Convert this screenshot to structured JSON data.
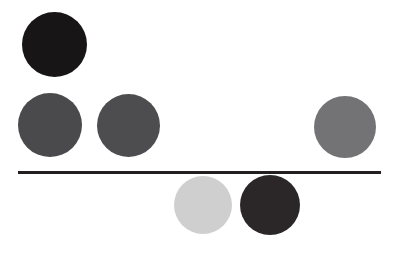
{
  "figure": {
    "title": "Grayscale circles above and below a horizontal rule",
    "background_color": "#ffffff",
    "width": 398,
    "height": 257
  },
  "chart_data": {
    "type": "scatter",
    "title": "Grayscale circles above and below a horizontal rule",
    "subtitle": "",
    "xlabel": "",
    "ylabel": "",
    "xlim": [
      0,
      398
    ],
    "ylim": [
      0,
      257
    ],
    "grid": false,
    "legend": "none",
    "background_color": "#ffffff",
    "annotations": [
      {
        "name": "horizontal-rule",
        "type": "line",
        "x_start": 18,
        "x_end": 381,
        "y": 172,
        "thickness": 3,
        "color": "#231f20"
      }
    ],
    "series": [
      {
        "name": "circles",
        "marker": "circle",
        "points": [
          {
            "label": "top-left near-black circle",
            "cx": 54,
            "cy": 44,
            "diameter": 65,
            "color": "#171515",
            "position": "above-rule"
          },
          {
            "label": "mid-left dark gray circle",
            "cx": 50,
            "cy": 125,
            "diameter": 64,
            "color": "#4a4a4d",
            "position": "above-rule"
          },
          {
            "label": "mid-center dark gray circle",
            "cx": 128,
            "cy": 125,
            "diameter": 63,
            "color": "#4d4d50",
            "position": "above-rule"
          },
          {
            "label": "right medium gray circle",
            "cx": 345,
            "cy": 127,
            "diameter": 62,
            "color": "#737376",
            "position": "above-rule"
          },
          {
            "label": "bottom-left light gray circle",
            "cx": 203,
            "cy": 205,
            "diameter": 58,
            "color": "#cfcfcf",
            "position": "below-rule"
          },
          {
            "label": "bottom-right near-black circle",
            "cx": 270,
            "cy": 205,
            "diameter": 60,
            "color": "#2b2728",
            "position": "below-rule"
          }
        ]
      }
    ]
  }
}
